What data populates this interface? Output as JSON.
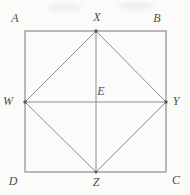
{
  "diagram": {
    "labels": {
      "A": "A",
      "B": "B",
      "C": "C",
      "D": "D",
      "X": "X",
      "Y": "Y",
      "Z": "Z",
      "W": "W",
      "E": "E"
    },
    "colors": {
      "background": "#fbfbf9",
      "line": "#8e8e8e",
      "vertex_dot": "#5a5a5a",
      "label_text": "#4f4f4f"
    }
  }
}
